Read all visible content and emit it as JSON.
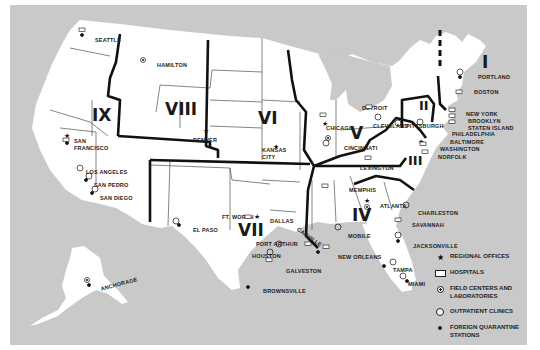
{
  "map": {
    "background_color": "#c9c9c9",
    "land_color": "#ffffff",
    "border_color": "#1a1a1a",
    "regions": [
      {
        "id": "I",
        "label": "I"
      },
      {
        "id": "II",
        "label": "II"
      },
      {
        "id": "III",
        "label": "III"
      },
      {
        "id": "IV",
        "label": "IV"
      },
      {
        "id": "V",
        "label": "V"
      },
      {
        "id": "VI",
        "label": "VI"
      },
      {
        "id": "VII",
        "label": "VII"
      },
      {
        "id": "VIII",
        "label": "VIII"
      },
      {
        "id": "IX",
        "label": "IX"
      }
    ],
    "cities": [
      {
        "name": "Seattle",
        "label": "SEATTLE"
      },
      {
        "name": "Hamilton",
        "label": "HAMILTON"
      },
      {
        "name": "San Francisco",
        "label": "SAN FRANCISCO"
      },
      {
        "name": "Los Angeles",
        "label": "LOS ANGELES"
      },
      {
        "name": "San Pedro",
        "label": "SAN PEDRO"
      },
      {
        "name": "San Diego",
        "label": "SAN DIEGO"
      },
      {
        "name": "Denver",
        "label": "DENVER"
      },
      {
        "name": "Kansas City",
        "label": "KANSAS CITY"
      },
      {
        "name": "El Paso",
        "label": "EL PASO"
      },
      {
        "name": "Ft. Worth",
        "label": "FT. WORTH"
      },
      {
        "name": "Dallas",
        "label": "DALLAS"
      },
      {
        "name": "Port Arthur",
        "label": "PORT ARTHUR"
      },
      {
        "name": "Houston",
        "label": "HOUSTON"
      },
      {
        "name": "Galveston",
        "label": "GALVESTON"
      },
      {
        "name": "Brownsville",
        "label": "BROWNSVILLE"
      },
      {
        "name": "Carville",
        "label": "CARVILLE"
      },
      {
        "name": "New Orleans",
        "label": "NEW ORLEANS"
      },
      {
        "name": "Mobile",
        "label": "MOBILE"
      },
      {
        "name": "Memphis",
        "label": "MEMPHIS"
      },
      {
        "name": "Chicago",
        "label": "CHICAGO"
      },
      {
        "name": "Detroit",
        "label": "DETROIT"
      },
      {
        "name": "Cleveland",
        "label": "CLEVELAND"
      },
      {
        "name": "Cincinnati",
        "label": "CINCINNATI"
      },
      {
        "name": "Lexington",
        "label": "LEXINGTON"
      },
      {
        "name": "Pittsburgh",
        "label": "PITTSBURGH"
      },
      {
        "name": "Atlanta",
        "label": "ATLANTA"
      },
      {
        "name": "Charleston",
        "label": "CHARLESTON"
      },
      {
        "name": "Savannah",
        "label": "SAVANNAH"
      },
      {
        "name": "Jacksonville",
        "label": "JACKSONVILLE"
      },
      {
        "name": "Tampa",
        "label": "TAMPA"
      },
      {
        "name": "Miami",
        "label": "MIAMI"
      },
      {
        "name": "Portland",
        "label": "PORTLAND"
      },
      {
        "name": "Boston",
        "label": "BOSTON"
      },
      {
        "name": "New York",
        "label": "NEW YORK"
      },
      {
        "name": "Brooklyn",
        "label": "BROOKLYN"
      },
      {
        "name": "Staten Island",
        "label": "STATEN ISLAND"
      },
      {
        "name": "Philadelphia",
        "label": "PHILADELPHIA"
      },
      {
        "name": "Baltimore",
        "label": "BALTIMORE"
      },
      {
        "name": "Washington",
        "label": "WASHINGTON"
      },
      {
        "name": "Norfolk",
        "label": "NORFOLK"
      },
      {
        "name": "Anchorage",
        "label": "ANCHORAGE"
      }
    ]
  },
  "legend": {
    "items": [
      {
        "symbol": "star-icon",
        "label": "REGIONAL OFFICES"
      },
      {
        "symbol": "hospital-rect-icon",
        "label": "HOSPITALS"
      },
      {
        "symbol": "dotted-circle-icon",
        "label": "FIELD CENTERS AND LABORATORIES"
      },
      {
        "symbol": "open-circle-icon",
        "label": "OUTPATIENT CLINICS"
      },
      {
        "symbol": "filled-dot-icon",
        "label": "FOREIGN QUARANTINE STATIONS"
      }
    ]
  }
}
